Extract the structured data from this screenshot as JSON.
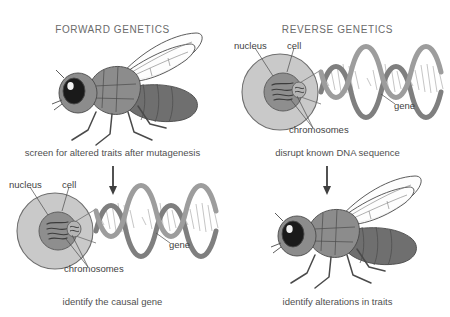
{
  "figure": {
    "background_color": "#ffffff",
    "ink_color": "#4a4a4a"
  },
  "columns": [
    {
      "id": "forward",
      "title": "FORWARD GENETICS"
    },
    {
      "id": "reverse",
      "title": "REVERSE GENETICS"
    }
  ],
  "panels": {
    "top_left": {
      "illustration": "fruit-fly",
      "caption": "screen for altered traits after mutagenesis"
    },
    "top_right": {
      "illustration": "cell-nucleus-dna",
      "caption": "disrupt known DNA sequence",
      "labels": {
        "nucleus": "nucleus",
        "cell": "cell",
        "gene": "gene",
        "chromosomes": "chromosomes"
      }
    },
    "bottom_left": {
      "illustration": "cell-nucleus-dna",
      "caption": "identify the causal gene",
      "labels": {
        "nucleus": "nucleus",
        "cell": "cell",
        "gene": "gene",
        "chromosomes": "chromosomes"
      }
    },
    "bottom_right": {
      "illustration": "fruit-fly",
      "caption": "identify alterations in traits"
    }
  },
  "arrows": [
    {
      "id": "left-flow-arrow",
      "direction": "down"
    },
    {
      "id": "right-flow-arrow",
      "direction": "down"
    }
  ],
  "colors": {
    "cell_fill": "#c9c9c9",
    "nucleus_fill": "#8e8e8e",
    "dna_strand": "#8a8a8a",
    "dna_strand_dark": "#6e6e6e",
    "fly_body": "#8c8c8c",
    "fly_abdomen": "#6f6f6f",
    "fly_eye": "#1a1a1a",
    "outline": "#4a4a4a",
    "text": "#4a4a4a"
  }
}
